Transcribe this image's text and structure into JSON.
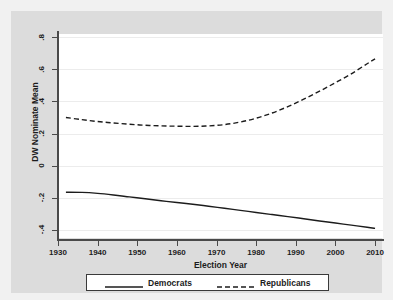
{
  "chart_data": {
    "type": "line",
    "title": "",
    "xlabel": "Election Year",
    "ylabel": "DW Nominate Mean",
    "xlim": [
      1930,
      2012
    ],
    "ylim": [
      -0.45,
      0.82
    ],
    "grid": true,
    "legend_position": "bottom-outside",
    "xticks": [
      "1930",
      "1940",
      "1950",
      "1960",
      "1970",
      "1980",
      "1990",
      "2000",
      "2010"
    ],
    "xtick_values": [
      1930,
      1940,
      1950,
      1960,
      1970,
      1980,
      1990,
      2000,
      2010
    ],
    "yticks": [
      ".8",
      ".6",
      ".4",
      ".2",
      "0",
      "-.2",
      "-.4"
    ],
    "ytick_values": [
      0.8,
      0.6,
      0.4,
      0.2,
      0,
      -0.2,
      -0.4
    ],
    "x": [
      1932,
      1936,
      1940,
      1944,
      1948,
      1952,
      1956,
      1960,
      1964,
      1968,
      1972,
      1976,
      1980,
      1984,
      1988,
      1992,
      1996,
      2000,
      2004,
      2008,
      2010
    ],
    "series": [
      {
        "name": "Democrats",
        "style": "solid",
        "color": "#1c1c1c",
        "values": [
          -0.165,
          -0.166,
          -0.172,
          -0.182,
          -0.194,
          -0.206,
          -0.218,
          -0.229,
          -0.24,
          -0.252,
          -0.265,
          -0.278,
          -0.291,
          -0.304,
          -0.317,
          -0.33,
          -0.344,
          -0.357,
          -0.37,
          -0.383,
          -0.39
        ]
      },
      {
        "name": "Republicans",
        "style": "dashed",
        "color": "#1c1c1c",
        "values": [
          0.3,
          0.287,
          0.275,
          0.266,
          0.258,
          0.252,
          0.248,
          0.246,
          0.245,
          0.248,
          0.256,
          0.272,
          0.296,
          0.328,
          0.368,
          0.414,
          0.464,
          0.517,
          0.572,
          0.635,
          0.665
        ]
      }
    ]
  }
}
